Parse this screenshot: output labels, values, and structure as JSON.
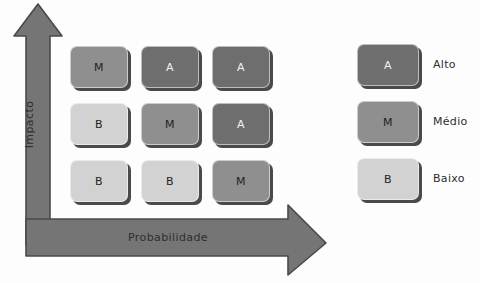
{
  "diagram": {
    "background_color": "#fdfdfd",
    "axis_color": "#757575",
    "axis_stroke_color": "#4a4a4a"
  },
  "axes": {
    "vertical": {
      "label": "Impacto",
      "direction": "up"
    },
    "horizontal": {
      "label": "Probabilidade",
      "direction": "right"
    }
  },
  "levels": {
    "A": {
      "code": "A",
      "name": "Alto",
      "color": "#6e6e6e",
      "text_color": "#f2f2f2"
    },
    "M": {
      "code": "M",
      "name": "Médio",
      "color": "#8f8f8f",
      "text_color": "#232323"
    },
    "B": {
      "code": "B",
      "name": "Baixo",
      "color": "#d2d2d2",
      "text_color": "#232323"
    }
  },
  "matrix": {
    "rows": 3,
    "columns": 3,
    "cells": [
      {
        "row": 0,
        "col": 0,
        "level": "M",
        "label": "M",
        "x": 70,
        "y": 46
      },
      {
        "row": 0,
        "col": 1,
        "level": "A",
        "label": "A",
        "x": 141,
        "y": 46
      },
      {
        "row": 0,
        "col": 2,
        "level": "A",
        "label": "A",
        "x": 212,
        "y": 46
      },
      {
        "row": 1,
        "col": 0,
        "level": "B",
        "label": "B",
        "x": 70,
        "y": 103
      },
      {
        "row": 1,
        "col": 1,
        "level": "M",
        "label": "M",
        "x": 141,
        "y": 103
      },
      {
        "row": 1,
        "col": 2,
        "level": "A",
        "label": "A",
        "x": 212,
        "y": 103
      },
      {
        "row": 2,
        "col": 0,
        "level": "B",
        "label": "B",
        "x": 70,
        "y": 160
      },
      {
        "row": 2,
        "col": 1,
        "level": "B",
        "label": "B",
        "x": 141,
        "y": 160
      },
      {
        "row": 2,
        "col": 2,
        "level": "M",
        "label": "M",
        "x": 212,
        "y": 160
      }
    ]
  },
  "legend": {
    "items": [
      {
        "code": "A",
        "label": "Alto",
        "level": "A"
      },
      {
        "code": "M",
        "label": "Médio",
        "level": "M"
      },
      {
        "code": "B",
        "label": "Baixo",
        "level": "B"
      }
    ]
  }
}
